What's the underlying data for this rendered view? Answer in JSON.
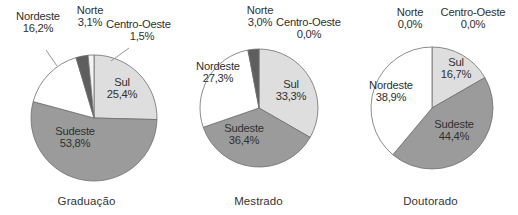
{
  "figure": {
    "title": "",
    "background": "#ffffff",
    "label_color": "#303030",
    "outline_color": "#6f6f6f"
  },
  "palette": {
    "sul": "#dedede",
    "sudeste": "#9b9b9b",
    "nordeste": "#ffffff",
    "norte": "#5e5e5e",
    "centro_oeste": "#f4f4f4"
  },
  "chart_data": [
    {
      "type": "pie",
      "title": "Graduação",
      "categories": [
        "Sul",
        "Sudeste",
        "Nordeste",
        "Norte",
        "Centro-Oeste"
      ],
      "values": [
        25.4,
        53.8,
        16.2,
        3.1,
        1.5
      ],
      "value_labels": [
        "25,4%",
        "53,8%",
        "16,2%",
        "3,1%",
        "1,5%"
      ],
      "colors": [
        "#dedede",
        "#9b9b9b",
        "#ffffff",
        "#5e5e5e",
        "#f4f4f4"
      ],
      "unit": "%",
      "start_angle_deg": 0,
      "direction": "clockwise",
      "legend": "none",
      "labels_inside": [
        "Sul",
        "Sudeste"
      ],
      "labels_outside": [
        "Nordeste",
        "Norte",
        "Centro-Oeste"
      ]
    },
    {
      "type": "pie",
      "title": "Mestrado",
      "categories": [
        "Sul",
        "Sudeste",
        "Nordeste",
        "Norte",
        "Centro-Oeste"
      ],
      "values": [
        33.3,
        36.4,
        27.3,
        3.0,
        0.0
      ],
      "value_labels": [
        "33,3%",
        "36,4%",
        "27,3%",
        "3,0%",
        "0,0%"
      ],
      "colors": [
        "#dedede",
        "#9b9b9b",
        "#ffffff",
        "#5e5e5e",
        "#f4f4f4"
      ],
      "unit": "%",
      "start_angle_deg": 0,
      "direction": "clockwise",
      "legend": "none",
      "labels_inside": [
        "Sul",
        "Sudeste",
        "Nordeste"
      ],
      "labels_outside": [
        "Norte",
        "Centro-Oeste"
      ]
    },
    {
      "type": "pie",
      "title": "Doutorado",
      "categories": [
        "Sul",
        "Sudeste",
        "Nordeste",
        "Norte",
        "Centro-Oeste"
      ],
      "values": [
        16.7,
        44.4,
        38.9,
        0.0,
        0.0
      ],
      "value_labels": [
        "16,7%",
        "44,4%",
        "38,9%",
        "0,0%",
        "0,0%"
      ],
      "colors": [
        "#dedede",
        "#9b9b9b",
        "#ffffff",
        "#5e5e5e",
        "#f4f4f4"
      ],
      "unit": "%",
      "start_angle_deg": 0,
      "direction": "clockwise",
      "legend": "none",
      "labels_inside": [
        "Sul",
        "Sudeste",
        "Nordeste"
      ],
      "labels_outside": [
        "Norte",
        "Centro-Oeste"
      ]
    }
  ],
  "charts": [
    {
      "caption": "Graduação",
      "labels": {
        "nordeste": {
          "name": "Nordeste",
          "pct": "16,2%"
        },
        "norte": {
          "name": "Norte",
          "pct": "3,1%"
        },
        "centro_oeste": {
          "name": "Centro-Oeste",
          "pct": "1,5%"
        },
        "sul": {
          "name": "Sul",
          "pct": "25,4%"
        },
        "sudeste": {
          "name": "Sudeste",
          "pct": "53,8%"
        }
      }
    },
    {
      "caption": "Mestrado",
      "labels": {
        "nordeste": {
          "name": "Nordeste",
          "pct": "27,3%"
        },
        "norte": {
          "name": "Norte",
          "pct": "3,0%"
        },
        "centro_oeste": {
          "name": "Centro-Oeste",
          "pct": "0,0%"
        },
        "sul": {
          "name": "Sul",
          "pct": "33,3%"
        },
        "sudeste": {
          "name": "Sudeste",
          "pct": "36,4%"
        }
      }
    },
    {
      "caption": "Doutorado",
      "labels": {
        "nordeste": {
          "name": "Nordeste",
          "pct": "38,9%"
        },
        "norte": {
          "name": "Norte",
          "pct": "0,0%"
        },
        "centro_oeste": {
          "name": "Centro-Oeste",
          "pct": "0,0%"
        },
        "sul": {
          "name": "Sul",
          "pct": "16,7%"
        },
        "sudeste": {
          "name": "Sudeste",
          "pct": "44,4%"
        }
      }
    }
  ]
}
